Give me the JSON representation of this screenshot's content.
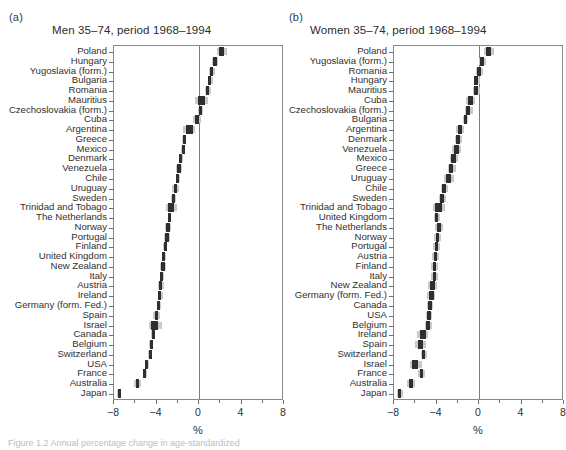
{
  "figure": {
    "caption": "Figure 1.2  Annual percentage change in age-standardized",
    "axis_title": "%"
  },
  "chart_data": {
    "type": "scatter",
    "xlabel": "%",
    "ylabel": "",
    "xlim": [
      -8,
      8
    ],
    "xticks": [
      -8,
      -4,
      0,
      4,
      8
    ],
    "xtick_labels": [
      "−8",
      "−4",
      "0",
      "4",
      "8"
    ],
    "minor_ticks": [
      -6,
      -2,
      2,
      6
    ],
    "grid": false,
    "legend": "none",
    "marker_color": "#2f2f2f",
    "ci_color": "#c9c9c9",
    "panels": [
      {
        "tag": "(a)",
        "title": "Men 35–74, period 1968–1994",
        "categories": [
          "Poland",
          "Hungary",
          "Yugoslavia (form.)",
          "Bulgaria",
          "Romania",
          "Mauritius",
          "Czechoslovakia (form.)",
          "Cuba",
          "Argentina",
          "Greece",
          "Mexico",
          "Denmark",
          "Venezuela",
          "Chile",
          "Uruguay",
          "Sweden",
          "Trinidad and Tobago",
          "The Netherlands",
          "Norway",
          "Portugal",
          "Finland",
          "United Kingdom",
          "New Zealand",
          "Italy",
          "Austria",
          "Ireland",
          "Germany (form. Fed.)",
          "Spain",
          "Israel",
          "Canada",
          "Belgium",
          "Switzerland",
          "USA",
          "France",
          "Australia",
          "Japan"
        ],
        "values": [
          2.1,
          1.5,
          1.2,
          1.0,
          0.8,
          0.2,
          0.1,
          -0.2,
          -0.9,
          -1.4,
          -1.5,
          -1.7,
          -1.9,
          -2.0,
          -2.2,
          -2.4,
          -2.6,
          -2.8,
          -2.9,
          -3.0,
          -3.2,
          -3.3,
          -3.4,
          -3.5,
          -3.6,
          -3.7,
          -3.8,
          -4.0,
          -4.2,
          -4.3,
          -4.5,
          -4.6,
          -4.9,
          -5.1,
          -5.8,
          -7.5
        ],
        "ci_low": [
          1.7,
          1.2,
          0.9,
          0.8,
          0.6,
          -0.4,
          -0.1,
          -0.6,
          -1.5,
          -1.6,
          -1.7,
          -1.9,
          -2.2,
          -2.2,
          -2.5,
          -2.6,
          -3.1,
          -2.9,
          -3.2,
          -3.3,
          -3.4,
          -3.5,
          -3.7,
          -3.7,
          -3.9,
          -3.9,
          -4.0,
          -4.3,
          -4.7,
          -4.5,
          -4.7,
          -4.8,
          -5.1,
          -5.3,
          -6.1,
          -7.7
        ],
        "ci_high": [
          2.6,
          1.8,
          1.5,
          1.3,
          1.1,
          0.8,
          0.4,
          0.2,
          -0.4,
          -1.2,
          -1.3,
          -1.5,
          -1.6,
          -1.8,
          -1.9,
          -2.2,
          -2.1,
          -2.6,
          -2.6,
          -2.7,
          -3.0,
          -3.1,
          -3.1,
          -3.3,
          -3.3,
          -3.4,
          -3.6,
          -3.7,
          -3.5,
          -4.1,
          -4.3,
          -4.4,
          -4.7,
          -4.9,
          -5.5,
          -7.3
        ]
      },
      {
        "tag": "(b)",
        "title": "Women 35–74, period 1968–1994",
        "categories": [
          "Poland",
          "Yugoslavia (form.)",
          "Romania",
          "Hungary",
          "Mauritius",
          "Cuba",
          "Czechoslovakia (form.)",
          "Bulgaria",
          "Argentina",
          "Denmark",
          "Venezuela",
          "Mexico",
          "Greece",
          "Uruguay",
          "Chile",
          "Sweden",
          "Trinidad and Tobago",
          "United Kingdom",
          "The Netherlands",
          "Norway",
          "Portugal",
          "Austria",
          "Finland",
          "Italy",
          "New Zealand",
          "Germany (form. Fed.)",
          "Canada",
          "USA",
          "Belgium",
          "Ireland",
          "Spain",
          "Switzerland",
          "Israel",
          "France",
          "Australia",
          "Japan"
        ],
        "values": [
          0.9,
          0.3,
          0.0,
          -0.3,
          -0.3,
          -0.8,
          -1.0,
          -1.3,
          -1.8,
          -2.0,
          -2.1,
          -2.4,
          -2.6,
          -2.9,
          -3.3,
          -3.5,
          -3.8,
          -4.0,
          -3.8,
          -3.9,
          -4.0,
          -4.1,
          -4.2,
          -4.2,
          -4.4,
          -4.5,
          -4.6,
          -4.7,
          -4.8,
          -5.3,
          -5.5,
          -5.2,
          -6.0,
          -5.4,
          -6.4,
          -7.5
        ],
        "ci_low": [
          0.5,
          0.0,
          -0.3,
          -0.5,
          -0.6,
          -1.2,
          -1.3,
          -1.5,
          -2.2,
          -2.3,
          -2.5,
          -2.7,
          -2.9,
          -3.3,
          -3.6,
          -3.8,
          -4.3,
          -4.2,
          -4.1,
          -4.2,
          -4.3,
          -4.4,
          -4.5,
          -4.5,
          -4.8,
          -4.9,
          -4.9,
          -5.0,
          -5.1,
          -5.8,
          -6.0,
          -5.5,
          -6.5,
          -5.7,
          -6.8,
          -7.7
        ],
        "ci_high": [
          1.4,
          0.7,
          0.4,
          0.1,
          0.1,
          -0.4,
          -0.6,
          -1.0,
          -1.4,
          -1.6,
          -1.7,
          -2.0,
          -2.2,
          -2.4,
          -2.9,
          -3.1,
          -3.2,
          -3.7,
          -3.4,
          -3.6,
          -3.7,
          -3.8,
          -3.9,
          -3.9,
          -4.0,
          -4.1,
          -4.3,
          -4.4,
          -4.4,
          -4.8,
          -5.0,
          -4.9,
          -5.4,
          -5.1,
          -6.0,
          -7.2
        ]
      }
    ]
  }
}
